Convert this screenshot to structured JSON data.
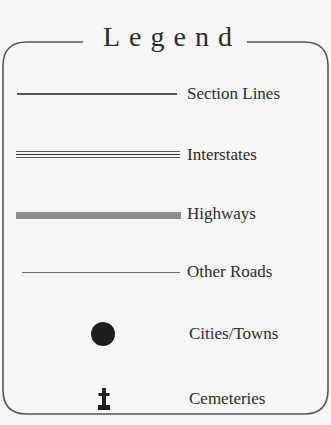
{
  "legend": {
    "title": "Legend",
    "items": [
      {
        "label": "Section Lines",
        "symbol": "thin-solid-line"
      },
      {
        "label": "Interstates",
        "symbol": "triple-line"
      },
      {
        "label": "Highways",
        "symbol": "thick-gray-line"
      },
      {
        "label": "Other Roads",
        "symbol": "hairline"
      },
      {
        "label": "Cities/Towns",
        "symbol": "filled-circle"
      },
      {
        "label": "Cemeteries",
        "symbol": "cemetery-cross"
      }
    ]
  },
  "colors": {
    "background": "#f7f7f6",
    "text": "#2a2a2a",
    "border": "#555555",
    "highway": "#8e8e8e",
    "city_dot": "#1e1e1e"
  }
}
